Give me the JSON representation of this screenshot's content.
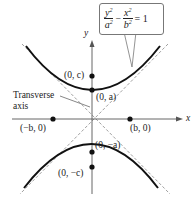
{
  "diagram": {
    "type": "hyperbola-vertical",
    "equation": {
      "term1_num": "y",
      "term1_den": "a",
      "term2_num": "x",
      "term2_den": "b",
      "exponent": "2",
      "minus": "−",
      "equals": "= 1"
    },
    "axis_labels": {
      "x": "x",
      "y": "y"
    },
    "points": [
      {
        "label": "(0, c)"
      },
      {
        "label": "(0, a)"
      },
      {
        "label": "(−b, 0)"
      },
      {
        "label": "(b, 0)"
      },
      {
        "label": "(0, −a)"
      },
      {
        "label": "(0, −c)"
      }
    ],
    "annotation": {
      "line1": "Transverse",
      "line2": "axis"
    },
    "colors": {
      "curve": "#111111",
      "asymptote": "#888888",
      "axis": "#555555"
    }
  }
}
